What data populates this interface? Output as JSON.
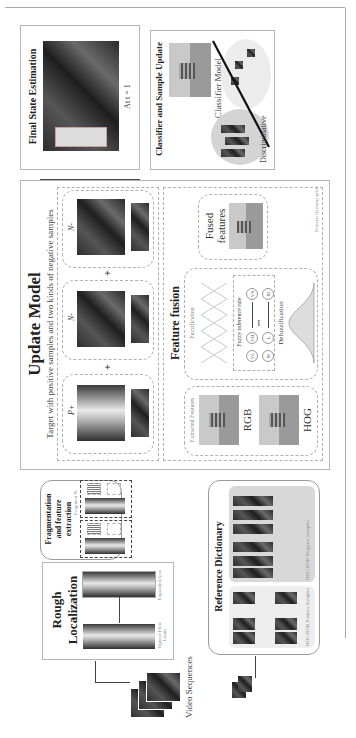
{
  "rough_localization": {
    "title_line1": "Rough",
    "title_line2": "Localization",
    "left_caption": "Optical Flow Limits",
    "right_caption": "Expanded Area"
  },
  "video_sequences": {
    "label": "Video Sequences"
  },
  "fragmentation": {
    "title_line1": "Fragmentation",
    "title_line2": "and feature",
    "title_line3": "extraction",
    "hist1_label": "RGB",
    "hist2_label": "HOG",
    "fragment_n_label": "Fragment N",
    "ellipsis": "..."
  },
  "reference_dictionary": {
    "title": "Reference Dictionary",
    "positive_label": "HOG RGB Positive Samples",
    "negative_label": "HOG RGB Negative Samples"
  },
  "update_model": {
    "title": "Update Model",
    "subtitle": "Target with positive samples and two kinds of negative samples",
    "p_label": "P+",
    "n1_label": "N-",
    "n2_label": "N-",
    "fragment_label": "Fragment",
    "plus": "+"
  },
  "feature_fusion": {
    "title": "Feature fusion",
    "extracted_features": "Extracted Features",
    "rgb_label": "RGB",
    "hog_label": "HOG",
    "fuzzification": "Fuzzification",
    "fuzzy_rule": "Fuzzy inference rule",
    "rule_nodes": [
      "VL",
      "VH",
      "VS",
      "M",
      "L",
      "M"
    ],
    "ellipsis": "•••",
    "defuzzification": "Defuzzification",
    "fused_line1": "Fused",
    "fused_line2": "features",
    "ref_update": "Reference Dictionary update"
  },
  "classifier": {
    "title": "Classifier and Sample Update",
    "model_label": "Classifier Model",
    "boundary_line1": "Discriminative",
    "boundary_line2": "boundary"
  },
  "final_state": {
    "title": "Final State Estimation",
    "caption": "At t = 1"
  }
}
